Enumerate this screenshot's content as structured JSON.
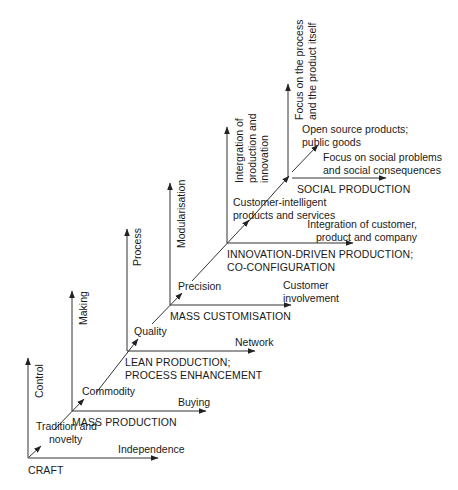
{
  "diagram": {
    "title": "",
    "line_color": "#333333",
    "stages": [
      {
        "name": "CRAFT",
        "stage_label": [
          "CRAFT"
        ],
        "vertical_axis": "Control",
        "horizontal_axis": "Independence",
        "diagonal_label": [
          "Tradition and",
          "novelty"
        ]
      },
      {
        "name": "MASS PRODUCTION",
        "stage_label": [
          "MASS PRODUCTION"
        ],
        "vertical_axis": "Making",
        "horizontal_axis": "Buying",
        "diagonal_label": [
          "Commodity"
        ]
      },
      {
        "name": "LEAN PRODUCTION",
        "stage_label": [
          "LEAN PRODUCTION;",
          "PROCESS ENHANCEMENT"
        ],
        "vertical_axis": "Process",
        "horizontal_axis": "Network",
        "diagonal_label": [
          "Quality"
        ]
      },
      {
        "name": "MASS CUSTOMISATION",
        "stage_label": [
          "MASS CUSTOMISATION"
        ],
        "vertical_axis": "Modularisation",
        "horizontal_axis": [
          "Customer",
          "involvement"
        ],
        "diagonal_label": [
          "Precision"
        ]
      },
      {
        "name": "INNOVATION-DRIVEN PRODUCTION",
        "stage_label": [
          "INNOVATION-DRIVEN PRODUCTION;",
          "CO-CONFIGURATION"
        ],
        "vertical_axis": [
          "Intergration of",
          "production and",
          "innovation"
        ],
        "horizontal_axis": [
          "Integration of customer,",
          "product and company"
        ],
        "diagonal_label": [
          "Customer-intelligent",
          "products and services"
        ]
      },
      {
        "name": "SOCIAL PRODUCTION",
        "stage_label": [
          "SOCIAL PRODUCTION"
        ],
        "vertical_axis": [
          "Focus on the process",
          "and the product itself"
        ],
        "horizontal_axis": [
          "Focus on social problems",
          "and social consequences"
        ],
        "diagonal_label": [
          "Open source products;",
          "public goods"
        ]
      }
    ]
  }
}
